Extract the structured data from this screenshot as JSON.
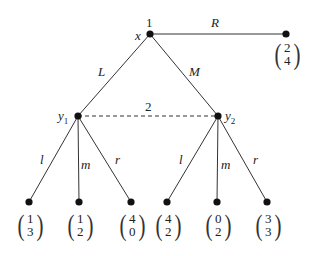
{
  "diagram": {
    "type": "extensive-form game tree",
    "root": {
      "node_label": "x",
      "player": "1"
    },
    "root_actions": [
      "L",
      "M",
      "R"
    ],
    "information_set": {
      "player": "2",
      "nodes": [
        "y1",
        "y2"
      ]
    },
    "node_y1": {
      "name": "y",
      "sub": "1"
    },
    "node_y2": {
      "name": "y",
      "sub": "2"
    },
    "player2_actions": [
      "l",
      "m",
      "r"
    ],
    "payoffs": {
      "R": {
        "p1": "2",
        "p2": "4"
      },
      "L_l": {
        "p1": "1",
        "p2": "3"
      },
      "L_m": {
        "p1": "1",
        "p2": "2"
      },
      "L_r": {
        "p1": "4",
        "p2": "0"
      },
      "M_l": {
        "p1": "4",
        "p2": "2"
      },
      "M_m": {
        "p1": "0",
        "p2": "2"
      },
      "M_r": {
        "p1": "3",
        "p2": "3"
      }
    },
    "parens": {
      "open": "(",
      "close": ")"
    }
  }
}
